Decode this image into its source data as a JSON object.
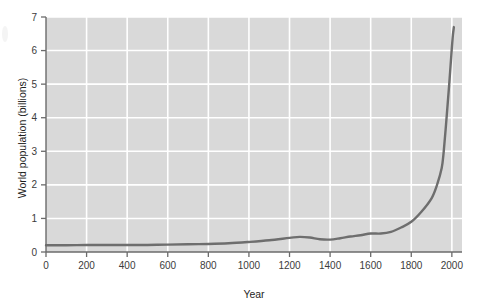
{
  "figure": {
    "background_color": "#ffffff",
    "plot_background_color": "#d9d9d9",
    "gridline_color": "#ffffff",
    "axis_color": "#6b6b6b",
    "curve_color": "#6e6e6e",
    "tick_label_color": "#3b3b3b"
  },
  "chart_data": {
    "type": "line",
    "title": "",
    "subtitle": "",
    "xlabel": "Year",
    "ylabel": "World population (billions)",
    "xlim": [
      0,
      2050
    ],
    "ylim": [
      0,
      7
    ],
    "grid": true,
    "legend": false,
    "legend_position": "none",
    "xticks": [
      0,
      200,
      400,
      600,
      800,
      1000,
      1200,
      1400,
      1600,
      1800,
      2000
    ],
    "xtick_labels": [
      "0",
      "200",
      "400",
      "600",
      "800",
      "1000",
      "1200",
      "1400",
      "1600",
      "1800",
      "2000"
    ],
    "yticks": [
      0,
      1,
      2,
      3,
      4,
      5,
      6,
      7
    ],
    "ytick_labels": [
      "0",
      "1",
      "2",
      "3",
      "4",
      "5",
      "6",
      "7"
    ],
    "series": [
      {
        "name": "World population",
        "color": "#6e6e6e",
        "x": [
          0,
          100,
          200,
          300,
          400,
          500,
          600,
          700,
          800,
          900,
          1000,
          1100,
          1200,
          1250,
          1300,
          1350,
          1400,
          1450,
          1500,
          1550,
          1600,
          1650,
          1700,
          1750,
          1800,
          1850,
          1900,
          1927,
          1950,
          1960,
          1974,
          1987,
          1999,
          2005,
          2010
        ],
        "y": [
          0.2,
          0.2,
          0.21,
          0.21,
          0.21,
          0.21,
          0.22,
          0.23,
          0.24,
          0.26,
          0.3,
          0.35,
          0.42,
          0.45,
          0.43,
          0.38,
          0.37,
          0.41,
          0.46,
          0.5,
          0.55,
          0.55,
          0.6,
          0.73,
          0.9,
          1.2,
          1.6,
          2.0,
          2.5,
          3.0,
          4.0,
          5.0,
          6.0,
          6.45,
          6.7
        ]
      }
    ],
    "annotations": []
  }
}
